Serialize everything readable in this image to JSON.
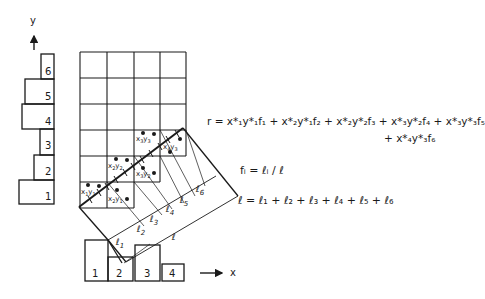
{
  "diagram": {
    "y_axis": {
      "label": "y"
    },
    "x_axis": {
      "label": "x"
    },
    "y_projection": {
      "bins": [
        "1",
        "2",
        "3",
        "4",
        "5",
        "6"
      ]
    },
    "x_projection": {
      "bins": [
        "1",
        "2",
        "3",
        "4"
      ]
    },
    "grid": {
      "columns": 4,
      "rows": 6
    },
    "cell_labels": [
      {
        "id": "x1y1",
        "x": "x",
        "xs": "1",
        "y": "y",
        "ys": "1"
      },
      {
        "id": "x2y1",
        "x": "x",
        "xs": "2",
        "y": "y",
        "ys": "1"
      },
      {
        "id": "x2y2",
        "x": "x",
        "xs": "2",
        "y": "y",
        "ys": "2"
      },
      {
        "id": "x3y2",
        "x": "x",
        "xs": "3",
        "y": "y",
        "ys": "2"
      },
      {
        "id": "x3y3",
        "x": "x",
        "xs": "3",
        "y": "y",
        "ys": "3"
      },
      {
        "id": "x4y3",
        "x": "x",
        "xs": "4",
        "y": "y",
        "ys": "3"
      }
    ],
    "segment_labels": [
      {
        "name": "ℓ",
        "sub": "1"
      },
      {
        "name": "ℓ",
        "sub": "2"
      },
      {
        "name": "ℓ",
        "sub": "3"
      },
      {
        "name": "ℓ",
        "sub": "4"
      },
      {
        "name": "ℓ",
        "sub": "5"
      },
      {
        "name": "ℓ",
        "sub": "6"
      }
    ],
    "total_length_label": "ℓ"
  },
  "equations": {
    "r_line1": "r = x*₁y*₁f₁ + x*₂y*₁f₂ + x*₂y*₂f₃ + x*₃y*₂f₄ + x*₃y*₃f₅",
    "r_line2": "+ x*₄y*₃f₆",
    "fi": "fᵢ = ℓᵢ / ℓ",
    "l_sum": "ℓ = ℓ₁ + ℓ₂ + ℓ₃ + ℓ₄ + ℓ₅ + ℓ₆"
  }
}
